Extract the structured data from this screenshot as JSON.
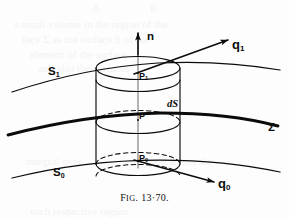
{
  "figure": {
    "caption_prefix": "F",
    "caption_smallcaps": "IG",
    "caption_number": ". 13·70.",
    "caption_full": "Fig. 13·70.",
    "ink_color": "#0b0b0b",
    "page_color": "#fdfdfd"
  },
  "labels": {
    "normal_vector": "n",
    "flux_top_base": "q",
    "flux_top_sub": "1",
    "flux_bottom_base": "q",
    "flux_bottom_sub": "0",
    "surface_top_base": "S",
    "surface_top_sub": "1",
    "surface_bottom_base": "S",
    "surface_bottom_sub": "0",
    "interface": "Σ",
    "point_top_base": "P",
    "point_top_sub": "1",
    "point_mid": "P",
    "point_bottom_base": "P",
    "point_bottom_sub": "0",
    "area_element": "dS"
  },
  "bleedthrough": [
    {
      "text": "A",
      "x": 92,
      "y": 2
    },
    {
      "text": "B",
      "x": 150,
      "y": 2
    },
    {
      "text": "a small volume in the region of the",
      "x": 14,
      "y": 18
    },
    {
      "text": "face Σ as the surface S of the",
      "x": 22,
      "y": 33
    },
    {
      "text": "element of the surface",
      "x": 30,
      "y": 48
    },
    {
      "text": "and also the surfaces",
      "x": 38,
      "y": 62
    },
    {
      "text": "integral over",
      "x": 26,
      "y": 155
    },
    {
      "text": "and across the",
      "x": 150,
      "y": 155
    },
    {
      "text": "each respective region",
      "x": 30,
      "y": 205
    }
  ],
  "geometry": {
    "cylinder_left_x": 96,
    "cylinder_right_x": 180,
    "cylinder_top_y": 68,
    "cylinder_bottom_y": 164,
    "ellipse_rx": 42,
    "ellipse_ry": 11,
    "mid_ellipse_y": 116,
    "axis_x": 138
  }
}
